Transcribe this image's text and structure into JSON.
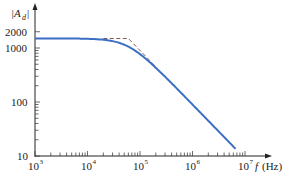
{
  "chart_data": {
    "type": "line",
    "title": "",
    "xlabel": "f (Hz)",
    "ylabel": "|A_d|",
    "xscale": "log",
    "yscale": "log",
    "xlim": [
      1000,
      10000000
    ],
    "ylim": [
      10,
      3000
    ],
    "grid": false,
    "x_ticks": [
      {
        "value": 1000,
        "label": "10",
        "exp": "3"
      },
      {
        "value": 10000,
        "label": "10",
        "exp": "4"
      },
      {
        "value": 100000,
        "label": "10",
        "exp": "5"
      },
      {
        "value": 1000000,
        "label": "10",
        "exp": "6"
      },
      {
        "value": 10000000,
        "label": "10",
        "exp": "7"
      }
    ],
    "y_ticks": [
      {
        "value": 10,
        "label": "10"
      },
      {
        "value": 100,
        "label": "100"
      },
      {
        "value": 1000,
        "label": "1000"
      },
      {
        "value": 2000,
        "label": "2000"
      }
    ],
    "series": [
      {
        "name": "actual response",
        "style": "solid",
        "color": "#3a6fc4",
        "x": [
          1000,
          10000,
          20000,
          40000,
          60000,
          100000,
          200000,
          500000,
          1000000,
          2000000,
          5000000,
          6800000
        ],
        "y": [
          1500,
          1500,
          1480,
          1350,
          1250,
          860,
          450,
          180,
          90,
          45,
          18,
          13
        ]
      },
      {
        "name": "asymptotic approximation",
        "style": "dashed",
        "color": "#8a5a5a",
        "x": [
          20000,
          60000,
          200000
        ],
        "y": [
          1500,
          1500,
          450
        ]
      }
    ],
    "corner_frequency_hz": 60000,
    "dc_gain": 1500
  },
  "labels": {
    "y_axis_main": "|A",
    "y_axis_sub": "d",
    "y_axis_end": "|",
    "x_axis_f": "f",
    "x_axis_unit": "(Hz)",
    "y_ticks": [
      "2000",
      "1000",
      "100",
      "10"
    ],
    "x_base": "10",
    "x_exps": [
      "3",
      "4",
      "5",
      "6",
      "7"
    ]
  }
}
